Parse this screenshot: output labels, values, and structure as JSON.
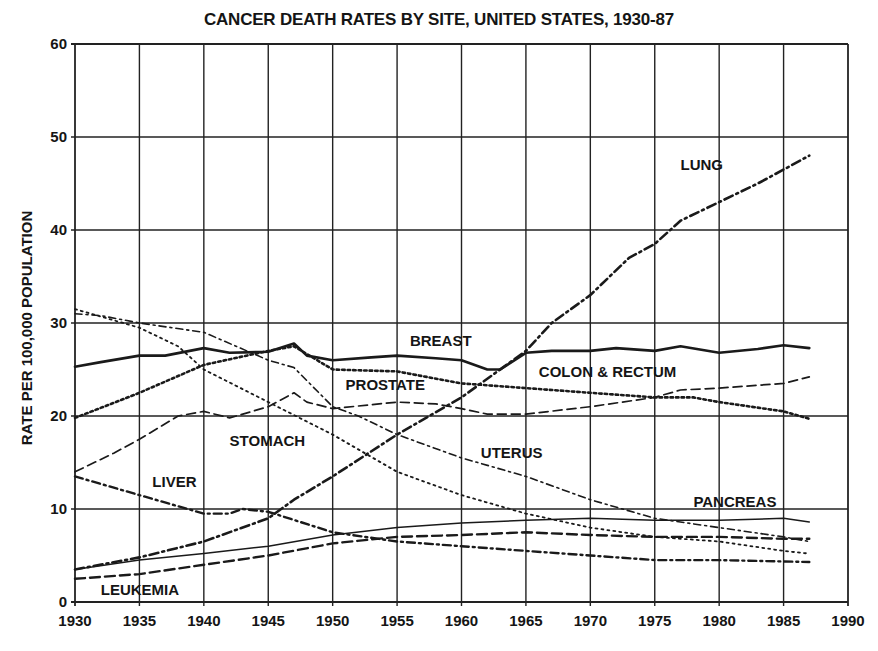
{
  "chart_data": {
    "type": "line",
    "title": "CANCER DEATH RATES BY SITE, UNITED STATES, 1930-87",
    "xlabel": "",
    "ylabel": "RATE PER 100,000 POPULATION",
    "xlim": [
      1930,
      1990
    ],
    "ylim": [
      0,
      60
    ],
    "grid": true,
    "legend": "inline labels",
    "x_ticks": [
      "1930",
      "1935",
      "1940",
      "1945",
      "1950",
      "1955",
      "1960",
      "1965",
      "1970",
      "1975",
      "1980",
      "1985",
      "1990"
    ],
    "y_ticks": [
      "0",
      "10",
      "20",
      "30",
      "40",
      "50",
      "60"
    ],
    "series": [
      {
        "name": "LUNG",
        "style": "dashdot-heavy",
        "label_pos": [
          1977,
          46.5
        ],
        "x": [
          1930,
          1935,
          1940,
          1945,
          1947,
          1950,
          1955,
          1960,
          1965,
          1967,
          1970,
          1973,
          1975,
          1977,
          1980,
          1983,
          1985,
          1987
        ],
        "values": [
          3.5,
          4.8,
          6.5,
          9,
          11,
          13.5,
          18,
          22,
          27,
          30,
          33,
          37,
          38.5,
          41,
          43,
          45,
          46.5,
          48
        ]
      },
      {
        "name": "BREAST",
        "style": "solid-heavy",
        "label_pos": [
          1956,
          27.5
        ],
        "x": [
          1930,
          1932,
          1935,
          1937,
          1940,
          1942,
          1945,
          1947,
          1948,
          1950,
          1953,
          1955,
          1958,
          1960,
          1962,
          1963,
          1965,
          1967,
          1970,
          1972,
          1975,
          1977,
          1980,
          1983,
          1985,
          1987
        ],
        "values": [
          25.3,
          25.8,
          26.5,
          26.5,
          27.3,
          26.8,
          26.9,
          27.8,
          26.5,
          26,
          26.3,
          26.5,
          26.2,
          26,
          25,
          25,
          26.8,
          27,
          27,
          27.3,
          27,
          27.5,
          26.8,
          27.2,
          27.6,
          27.3
        ]
      },
      {
        "name": "COLON & RECTUM",
        "style": "dotted-heavy",
        "label_pos": [
          1966,
          24.2
        ],
        "x": [
          1930,
          1935,
          1940,
          1945,
          1947,
          1950,
          1955,
          1960,
          1965,
          1970,
          1975,
          1978,
          1980,
          1985,
          1987
        ],
        "values": [
          19.8,
          22.5,
          25.5,
          27,
          27.5,
          25,
          24.8,
          23.5,
          23,
          22.5,
          22,
          22,
          21.5,
          20.5,
          19.7
        ]
      },
      {
        "name": "PROSTATE",
        "style": "longdash",
        "label_pos": [
          1951,
          22.8
        ],
        "x": [
          1930,
          1933,
          1935,
          1938,
          1940,
          1942,
          1945,
          1947,
          1948,
          1950,
          1955,
          1958,
          1960,
          1962,
          1965,
          1970,
          1975,
          1977,
          1980,
          1985,
          1987
        ],
        "values": [
          14,
          16,
          17.5,
          20,
          20.5,
          19.8,
          21,
          22.5,
          21.5,
          20.8,
          21.5,
          21.3,
          20.8,
          20.2,
          20.2,
          21,
          22,
          22.8,
          23,
          23.5,
          24.2
        ]
      },
      {
        "name": "STOMACH",
        "style": "dotted-thin",
        "label_pos": [
          1942,
          16.8
        ],
        "x": [
          1930,
          1935,
          1938,
          1940,
          1945,
          1950,
          1955,
          1960,
          1965,
          1970,
          1975,
          1980,
          1985,
          1987
        ],
        "values": [
          31.5,
          29.5,
          27.5,
          25,
          21.5,
          18,
          14,
          11.5,
          9.5,
          8,
          7,
          6.5,
          5.5,
          5.2
        ]
      },
      {
        "name": "UTERUS",
        "style": "dashdot-thin",
        "label_pos": [
          1961.5,
          15.5
        ],
        "x": [
          1930,
          1932,
          1935,
          1940,
          1945,
          1947,
          1950,
          1952,
          1955,
          1960,
          1965,
          1970,
          1975,
          1980,
          1985,
          1987
        ],
        "values": [
          31,
          30.8,
          30,
          29,
          26,
          25.2,
          21,
          20,
          18,
          15.5,
          13.5,
          11,
          9,
          8,
          7,
          6.5
        ]
      },
      {
        "name": "LIVER",
        "style": "dashdot-heavy2",
        "label_pos": [
          1936,
          12.4
        ],
        "x": [
          1930,
          1935,
          1940,
          1942,
          1943,
          1945,
          1950,
          1955,
          1960,
          1965,
          1970,
          1975,
          1980,
          1987
        ],
        "values": [
          13.5,
          11.5,
          9.5,
          9.5,
          10,
          9.7,
          7.5,
          6.5,
          6,
          5.5,
          5,
          4.5,
          4.5,
          4.3
        ]
      },
      {
        "name": "PANCREAS",
        "style": "solid-thin",
        "label_pos": [
          1978,
          10.2
        ],
        "x": [
          1930,
          1935,
          1940,
          1945,
          1950,
          1955,
          1960,
          1965,
          1970,
          1975,
          1980,
          1985,
          1987
        ],
        "values": [
          3.5,
          4.5,
          5.2,
          6,
          7.2,
          8,
          8.5,
          8.8,
          9,
          8.8,
          8.8,
          9,
          8.6
        ]
      },
      {
        "name": "LEUKEMIA",
        "style": "longdash-heavy",
        "label_pos": [
          1932,
          0.7
        ],
        "x": [
          1930,
          1935,
          1940,
          1945,
          1950,
          1955,
          1960,
          1965,
          1970,
          1975,
          1980,
          1985,
          1987
        ],
        "values": [
          2.5,
          3,
          4,
          5,
          6.3,
          7,
          7.2,
          7.5,
          7.2,
          7,
          7,
          6.8,
          6.8
        ]
      }
    ]
  }
}
